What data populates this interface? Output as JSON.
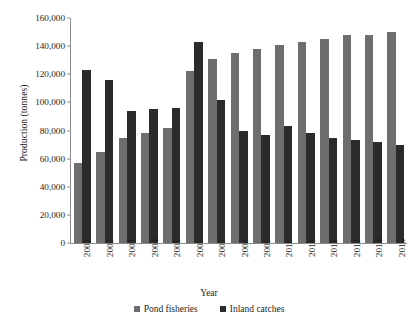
{
  "chart_data": {
    "type": "bar",
    "title": "",
    "xlabel": "Year",
    "ylabel": "Production (tonnes)",
    "ylim": [
      0,
      160000
    ],
    "yticks": [
      0,
      20000,
      40000,
      60000,
      80000,
      100000,
      120000,
      140000,
      160000
    ],
    "ytick_labels": [
      "0",
      "20,000",
      "40,000",
      "60,000",
      "80,000",
      "100,000",
      "120,000",
      "140,000",
      "160,000"
    ],
    "grid": false,
    "legend_position": "bottom",
    "categories": [
      "2001",
      "2002",
      "2003",
      "2004",
      "2005",
      "2006",
      "2007",
      "2008",
      "2009",
      "2010",
      "2011",
      "2012",
      "2013",
      "2014",
      "2015"
    ],
    "series": [
      {
        "name": "Pond fisheries",
        "color": "#6e6e6e",
        "values": [
          57000,
          65000,
          75000,
          78000,
          82000,
          122000,
          131000,
          135000,
          138000,
          141000,
          143000,
          145000,
          148000,
          148000,
          150000
        ]
      },
      {
        "name": "Inland catches",
        "color": "#2b2b2b",
        "values": [
          123000,
          116000,
          94000,
          95000,
          96000,
          143000,
          102000,
          80000,
          77000,
          83000,
          78000,
          75000,
          73000,
          72000,
          70000
        ]
      }
    ]
  },
  "axes": {
    "y_title": "Production (tonnes)",
    "x_title": "Year"
  },
  "legend": {
    "items": [
      {
        "label": "Pond fisheries",
        "color": "#6e6e6e"
      },
      {
        "label": "Inland catches",
        "color": "#2b2b2b"
      }
    ]
  }
}
